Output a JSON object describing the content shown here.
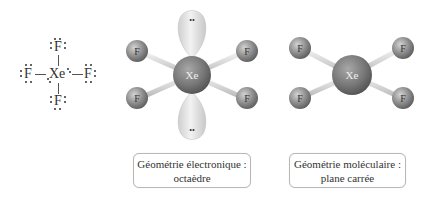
{
  "lewis": {
    "center": "Xe",
    "top": "F",
    "bottom": "F",
    "left": "F",
    "right": "F"
  },
  "model_electronic": {
    "center": "Xe",
    "ligands": [
      "F",
      "F",
      "F",
      "F"
    ],
    "lone_pair_symbol": "••",
    "colors": {
      "atom": "#8a8a8a",
      "lobe": "#e6e6e6",
      "bond": "#dcdcdc"
    }
  },
  "model_molecular": {
    "center": "Xe",
    "ligands": [
      "F",
      "F",
      "F",
      "F"
    ]
  },
  "labels": {
    "electronic_line1": "Géométrie électronique :",
    "electronic_line2": "octaèdre",
    "molecular_line1": "Géométrie moléculaire :",
    "molecular_line2": "plane carrée"
  }
}
